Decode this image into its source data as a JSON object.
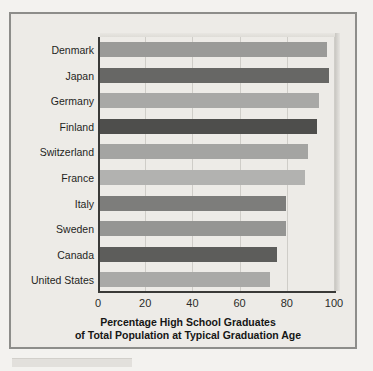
{
  "chart_data": {
    "type": "bar",
    "orientation": "horizontal",
    "title": "",
    "caption_line1": "Percentage High School Graduates",
    "caption_line2": "of Total Population at Typical Graduation Age",
    "xlabel": "",
    "ylabel": "",
    "xlim": [
      0,
      100
    ],
    "xticks": [
      "0",
      "20",
      "40",
      "60",
      "80",
      "100"
    ],
    "xtick_values": [
      0,
      20,
      40,
      60,
      80,
      100
    ],
    "grid": true,
    "grid_axis": "x",
    "legend": "none",
    "categories": [
      "Denmark",
      "Japan",
      "Germany",
      "Finland",
      "Switzerland",
      "France",
      "Italy",
      "Sweden",
      "Canada",
      "United States"
    ],
    "values": [
      96,
      97,
      93,
      92,
      88,
      87,
      79,
      79,
      75,
      72
    ],
    "bar_colors": [
      "#9a9a98",
      "#676765",
      "#a8a8a6",
      "#4e4e4c",
      "#a4a4a2",
      "#b2b2b0",
      "#7d7d7b",
      "#959593",
      "#5d5d5b",
      "#a9a9a7"
    ]
  },
  "figure": {
    "frame_color": "#8d8d8a",
    "panel_color": "#edebe7",
    "axis_color": "#3a3a38",
    "gridline_color": "#cfcdc8",
    "page_background": "#f3f2ef"
  }
}
